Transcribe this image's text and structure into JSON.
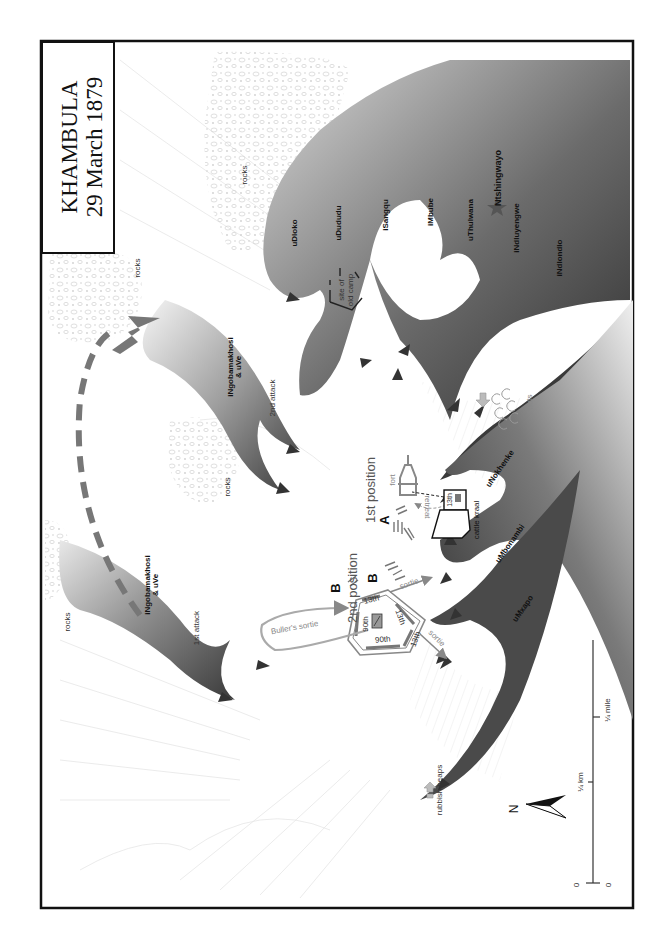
{
  "title": {
    "line1": "KHAMBULA",
    "line2": "29 March 1879"
  },
  "terrain": {
    "rocks_labels": [
      "rocks",
      "rocks",
      "rocks",
      "rocks"
    ],
    "huts_label": "huts",
    "rubbish_label": "rubbish heaps",
    "old_camp_label_1": "site of",
    "old_camp_label_2": "old camp"
  },
  "zulu": {
    "right_horn": {
      "regiment": "iNgobamakhosi",
      "regiment2": "& uVe",
      "attack1": "1st attack",
      "attack2": "2nd attack"
    },
    "chest_and_left": [
      {
        "name": "uDloko"
      },
      {
        "name": "uDududu"
      },
      {
        "name": "iSangqu"
      },
      {
        "name": "iMbube"
      },
      {
        "name": "uThulwana"
      },
      {
        "name": "iNdluyengwe"
      },
      {
        "name": "iNdlondlo"
      },
      {
        "name": "uNokhenke"
      },
      {
        "name": "uMbonambi"
      },
      {
        "name": "uMxapo"
      }
    ],
    "commander": "Ntshingwayo",
    "commander_icon": "star-icon",
    "color_dark": "#3a3a3a",
    "color_light": "#d8d8d8"
  },
  "british": {
    "first_position": "1st position",
    "second_position": "2nd position",
    "marker_a": "A",
    "marker_b1": "B",
    "marker_b2": "B",
    "fort_label": "fort",
    "retreat_label": "retreat",
    "cattle_kraal_label": "cattle kraal",
    "kraal_unit": "13th",
    "laager_units": [
      "13th",
      "13th",
      "13th",
      "90th",
      "90th"
    ],
    "sortie_label": "sortie",
    "sortie2_label": "sortie",
    "bullers_sortie": "Buller's sortie",
    "british_color": "#8a8a8a"
  },
  "scale": {
    "km_label": "¼ km",
    "mile_label": "¼ mile",
    "zero_left": "0",
    "zero_right": "0"
  },
  "compass": {
    "label": "N"
  }
}
